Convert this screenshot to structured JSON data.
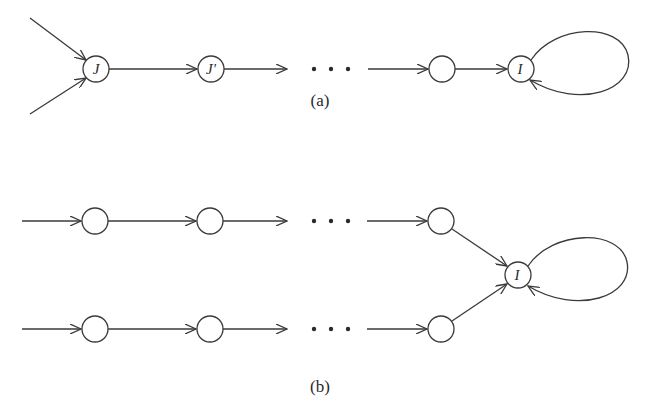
{
  "figure": {
    "subfigures": [
      {
        "id": "a",
        "caption": "(a)",
        "nodes": [
          {
            "id": "J",
            "label": "J"
          },
          {
            "id": "J_prime",
            "label": "J'"
          },
          {
            "id": "unnamed",
            "label": ""
          },
          {
            "id": "I",
            "label": "I"
          }
        ],
        "ellipsis": "· · ·",
        "description": "Two incoming edges into J, chain J -> J' -> ... -> node -> I, self-loop at I"
      },
      {
        "id": "b",
        "caption": "(b)",
        "rows": [
          {
            "nodes": [
              "",
              "",
              ""
            ]
          },
          {
            "nodes": [
              "",
              "",
              ""
            ]
          }
        ],
        "sink": {
          "id": "I",
          "label": "I"
        },
        "ellipsis": "· · ·",
        "description": "Two parallel chains merging into I, self-loop at I"
      }
    ],
    "colors": {
      "stroke": "#3a3a3a",
      "background": "#ffffff"
    }
  }
}
